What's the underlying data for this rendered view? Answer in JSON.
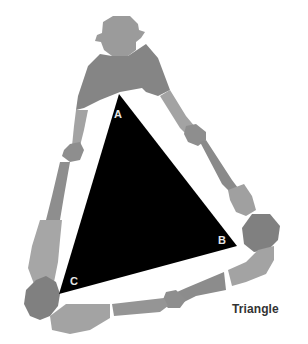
{
  "figure": {
    "caption": "Triangle",
    "triangle": {
      "fill": "#000000",
      "vertices": [
        {
          "label": "A",
          "x": 119,
          "y": 94
        },
        {
          "label": "B",
          "x": 237,
          "y": 246
        },
        {
          "label": "C",
          "x": 59,
          "y": 294
        }
      ]
    },
    "people_count": 3,
    "colors": {
      "dark_grey": "#7f7f7f",
      "mid_grey": "#959595",
      "light_grey": "#a9a9a9",
      "label": "#e6e6e6",
      "caption": "#333333"
    }
  }
}
